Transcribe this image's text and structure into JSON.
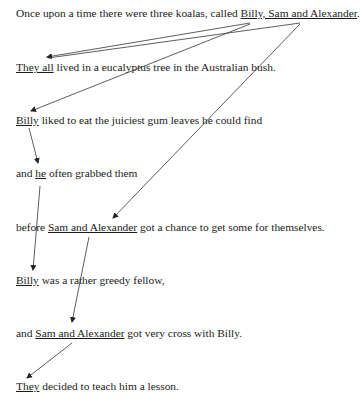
{
  "sentences": [
    {
      "pre": "Once upon a time there were three koalas, called ",
      "ref": "Billy, Sam and Alexander",
      "post": "."
    },
    {
      "pre": "",
      "ref": "They all",
      "post": " lived in a eucalyptus tree in the Australian bush."
    },
    {
      "pre": "",
      "ref": "Billy",
      "post": " liked to eat the juiciest gum leaves he could find"
    },
    {
      "pre": "and ",
      "ref": "he",
      "post": " often grabbed them"
    },
    {
      "pre": "before ",
      "ref": "Sam and Alexander",
      "post": " got a chance to get some for themselves."
    },
    {
      "pre": "",
      "ref": "Billy",
      "post": " was a rather greedy fellow,"
    },
    {
      "pre": "and ",
      "ref": "Sam and Alexander",
      "post": " got very cross with Billy."
    },
    {
      "pre": "",
      "ref": "They",
      "post": " decided to teach him a lesson."
    }
  ],
  "colors": {
    "text": "#1a1a1a",
    "arrow": "#333333"
  }
}
